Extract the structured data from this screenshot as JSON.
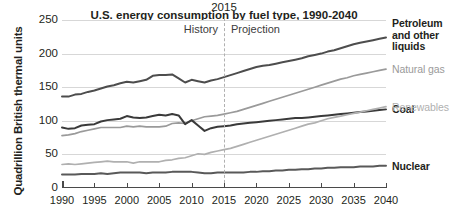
{
  "chart_data": {
    "type": "line",
    "title": "U.S. energy consumption by fuel type, 1990-2040",
    "xlabel": "",
    "ylabel": "Quadrillion British thermal units",
    "xlim": [
      1990,
      2040
    ],
    "ylim": [
      0,
      250
    ],
    "yticks": [
      0,
      50,
      100,
      150,
      200,
      250
    ],
    "xticks": [
      1990,
      1995,
      2000,
      2005,
      2010,
      2015,
      2020,
      2025,
      2030,
      2035,
      2040
    ],
    "grid": true,
    "legend_position": "right-inline",
    "annotations": {
      "divider_year": "2015",
      "divider_value": 2015,
      "history_label": "History",
      "projection_label": "Projection"
    },
    "x": [
      1990,
      1991,
      1992,
      1993,
      1994,
      1995,
      1996,
      1997,
      1998,
      1999,
      2000,
      2001,
      2002,
      2003,
      2004,
      2005,
      2006,
      2007,
      2008,
      2009,
      2010,
      2011,
      2012,
      2013,
      2014,
      2015,
      2016,
      2017,
      2018,
      2019,
      2020,
      2021,
      2022,
      2023,
      2024,
      2025,
      2026,
      2027,
      2028,
      2029,
      2030,
      2031,
      2032,
      2033,
      2034,
      2035,
      2036,
      2037,
      2038,
      2039,
      2040
    ],
    "series": [
      {
        "name": "Petroleum and other liquids",
        "color": "#4d4d4d",
        "width": 2.0,
        "values": [
          136,
          136,
          139,
          140,
          143,
          145,
          148,
          151,
          153,
          156,
          158,
          157,
          159,
          161,
          167,
          168,
          168,
          169,
          163,
          157,
          161,
          159,
          157,
          160,
          162,
          165,
          168,
          171,
          174,
          177,
          180,
          182,
          183,
          185,
          187,
          189,
          191,
          193,
          196,
          198,
          200,
          203,
          205,
          208,
          211,
          214,
          216,
          218,
          220,
          222,
          224
        ]
      },
      {
        "name": "Natural gas",
        "color": "#9a9a9a",
        "width": 1.7,
        "values": [
          78,
          79,
          81,
          84,
          86,
          88,
          90,
          90,
          90,
          90,
          92,
          91,
          92,
          91,
          91,
          91,
          92,
          96,
          97,
          96,
          100,
          103,
          106,
          107,
          108,
          110,
          112,
          114,
          117,
          120,
          123,
          126,
          129,
          132,
          135,
          138,
          141,
          144,
          147,
          150,
          153,
          156,
          159,
          162,
          164,
          167,
          169,
          171,
          173,
          175,
          177
        ]
      },
      {
        "name": "Coal",
        "color": "#3a3a3a",
        "width": 2.0,
        "values": [
          90,
          88,
          89,
          93,
          94,
          95,
          99,
          101,
          102,
          103,
          107,
          105,
          104,
          105,
          107,
          109,
          108,
          110,
          108,
          95,
          101,
          93,
          85,
          89,
          91,
          92,
          93,
          95,
          96,
          97,
          98,
          99,
          100,
          101,
          102,
          103,
          104,
          104,
          105,
          106,
          107,
          108,
          109,
          110,
          111,
          112,
          113,
          114,
          115,
          116,
          117
        ]
      },
      {
        "name": "Renewables",
        "color": "#b0b0b0",
        "width": 1.7,
        "values": [
          35,
          36,
          35,
          36,
          37,
          38,
          39,
          40,
          39,
          39,
          39,
          37,
          39,
          39,
          39,
          39,
          41,
          42,
          44,
          45,
          48,
          51,
          50,
          53,
          55,
          57,
          59,
          62,
          65,
          68,
          71,
          74,
          77,
          80,
          83,
          86,
          89,
          92,
          95,
          97,
          100,
          103,
          105,
          107,
          109,
          111,
          113,
          115,
          117,
          119,
          121
        ]
      },
      {
        "name": "Nuclear",
        "color": "#595959",
        "width": 2.0,
        "values": [
          20,
          20,
          20,
          21,
          21,
          21,
          22,
          21,
          22,
          23,
          23,
          23,
          23,
          22,
          23,
          23,
          23,
          24,
          24,
          24,
          24,
          23,
          22,
          22,
          23,
          23,
          23,
          23,
          23,
          24,
          24,
          25,
          25,
          26,
          26,
          27,
          27,
          28,
          28,
          29,
          29,
          30,
          30,
          31,
          31,
          31,
          32,
          32,
          32,
          33,
          33
        ]
      }
    ]
  },
  "yaxis": {
    "title": "Quadrillion British thermal units",
    "ticks": [
      "0",
      "50",
      "100",
      "150",
      "200",
      "250"
    ]
  },
  "xaxis": {
    "ticks": [
      "1990",
      "1995",
      "2000",
      "2005",
      "2010",
      "2015",
      "2020",
      "2025",
      "2030",
      "2035",
      "2040"
    ]
  },
  "series_labels": [
    {
      "text": "Petroleum\nand other\nliquids",
      "style": "bold"
    },
    {
      "text": "Natural gas",
      "style": "light"
    },
    {
      "text": "Coal",
      "style": "bold"
    },
    {
      "text": "Renewables",
      "style": "light"
    },
    {
      "text": "Nuclear",
      "style": "bold"
    }
  ],
  "annotations": {
    "divider_year": "2015",
    "history_label": "History",
    "projection_label": "Projection"
  }
}
